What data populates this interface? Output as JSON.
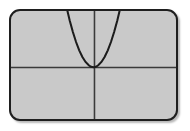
{
  "device": {
    "screen_name": "graphing-calculator-screen",
    "screen_background_color": "#c9c9c9",
    "screen_border_color": "#1e1e1e",
    "page_background_color": "#ffffff",
    "corner_radius_px": 11
  },
  "chart_data": {
    "type": "line",
    "title": "",
    "subtitle": "",
    "xlabel": "",
    "ylabel": "",
    "function_label": "y = x^2",
    "curve_color": "#1c1c1c",
    "axis_color": "#3a3a3a",
    "grid": false,
    "legend": false,
    "legend_position": "none",
    "tick_labels_x": [],
    "tick_labels_y": [],
    "xlim": [
      -5.2,
      5.2
    ],
    "ylim": [
      -1.7,
      3.5
    ],
    "origin_fraction": {
      "x": 0.5,
      "y": 0.52
    },
    "series": [
      {
        "name": "y = x^2",
        "x": [
          -1.88,
          -1.7,
          -1.5,
          -1.3,
          -1.1,
          -0.9,
          -0.7,
          -0.5,
          -0.3,
          -0.15,
          0,
          0.15,
          0.3,
          0.5,
          0.7,
          0.9,
          1.1,
          1.3,
          1.5,
          1.7,
          1.88
        ],
        "y": [
          3.53,
          2.89,
          2.25,
          1.69,
          1.21,
          0.81,
          0.49,
          0.25,
          0.09,
          0.02,
          0,
          0.02,
          0.09,
          0.25,
          0.49,
          0.81,
          1.21,
          1.69,
          2.25,
          2.89,
          3.53
        ]
      }
    ],
    "annotations": [
      {
        "name": "vertex",
        "x": 0,
        "y": 0,
        "text": ""
      }
    ]
  },
  "axes": {
    "x_axis_name": "horizontal-axis",
    "y_axis_name": "vertical-axis",
    "x_axis_visible": true,
    "y_axis_visible": true
  }
}
